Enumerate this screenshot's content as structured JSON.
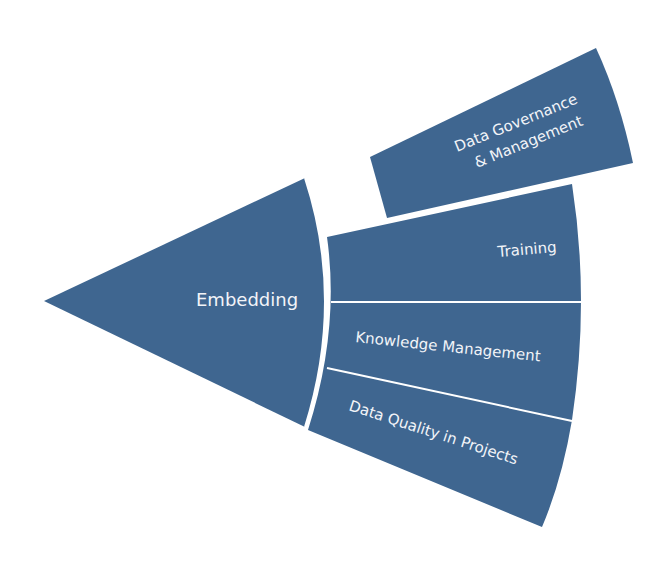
{
  "diagram": {
    "colors": {
      "segment_fill": "#3f6690",
      "divider": "#ffffff",
      "text": "#f2f4f8",
      "background": "#ffffff"
    },
    "center": {
      "label": "Embedding"
    },
    "detached": {
      "line1": "Data Governance",
      "line2": "& Management"
    },
    "ring": [
      {
        "label": "Training"
      },
      {
        "label": "Knowledge Management"
      },
      {
        "label": "Data Quality in Projects"
      }
    ]
  }
}
